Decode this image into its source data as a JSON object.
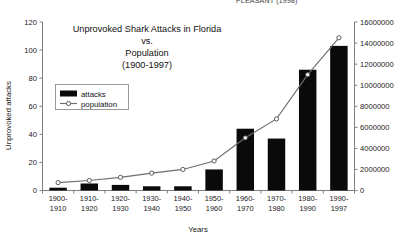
{
  "clipped_header": "PLEASANT (1998)",
  "chart_data": {
    "type": "bar",
    "title": "Unprovoked Shark Attacks in Florida",
    "title_lines": [
      "Unprovoked Shark Attacks in Florida",
      "vs.",
      "Population",
      "(1900-1997)"
    ],
    "xlabel": "Years",
    "ylabel": "Unprovoked attacks",
    "y2label": "",
    "ylim": [
      0,
      120
    ],
    "y2lim": [
      0,
      16000000
    ],
    "grid": false,
    "legend_position": "upper-left-inside",
    "categories": [
      "1900-1910",
      "1910-1920",
      "1920-1930",
      "1930-1940",
      "1940-1950",
      "1950-1960",
      "1960-1970",
      "1970-1980",
      "1980-1990",
      "1990-1997"
    ],
    "category_lines": [
      [
        "1900-",
        "1910"
      ],
      [
        "1910-",
        "1920"
      ],
      [
        "1920-",
        "1930"
      ],
      [
        "1930-",
        "1940"
      ],
      [
        "1940-",
        "1950"
      ],
      [
        "1950-",
        "1960"
      ],
      [
        "1960-",
        "1970"
      ],
      [
        "1970-",
        "1980"
      ],
      [
        "1980-",
        "1990"
      ],
      [
        "1990-",
        "1997"
      ]
    ],
    "yticks": [
      0,
      20,
      40,
      60,
      80,
      100,
      120
    ],
    "y2ticks": [
      0,
      2000000,
      4000000,
      6000000,
      8000000,
      10000000,
      12000000,
      14000000,
      16000000
    ],
    "y2ticklabels": [
      "0",
      "2000000",
      "4000000",
      "6000000",
      "8000000",
      "10000000",
      "12000000",
      "14000000",
      "16000000"
    ],
    "series": [
      {
        "name": "attacks",
        "axis": "left",
        "type": "bar",
        "color": "#0a0a0a",
        "values": [
          2,
          5,
          4,
          3,
          3,
          15,
          44,
          37,
          86,
          103
        ]
      },
      {
        "name": "population",
        "axis": "right",
        "type": "line",
        "color": "#6e6e6e",
        "marker": "open-circle",
        "values": [
          750000,
          950000,
          1250000,
          1650000,
          2000000,
          2800000,
          5000000,
          6800000,
          11000000,
          14500000
        ]
      }
    ]
  },
  "legend": {
    "items": [
      {
        "label": "attacks",
        "kind": "bar-swatch"
      },
      {
        "label": "population",
        "kind": "line-marker-swatch"
      }
    ]
  }
}
